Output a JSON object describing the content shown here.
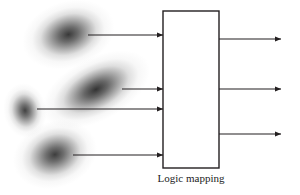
{
  "figure": {
    "background_color": "#ffffff",
    "stroke_color": "#231f20",
    "blob_color": "#4a4a4a",
    "caption": "Logic mapping",
    "caption_font_size": 11
  },
  "process_box": {
    "name": "Logic mapping",
    "x": 163,
    "y": 11,
    "width": 56,
    "height": 157,
    "border_color": "#231f20",
    "border_width": 1.4,
    "fill": "#ffffff"
  },
  "blobs": [
    {
      "id": "blob-1",
      "label": "",
      "cx": 68,
      "cy": 35,
      "rx": 24,
      "ry": 17,
      "rotation": -18,
      "intensity": 0.92
    },
    {
      "id": "blob-2",
      "label": "",
      "cx": 96,
      "cy": 90,
      "rx": 30,
      "ry": 16,
      "rotation": -28,
      "intensity": 0.95
    },
    {
      "id": "blob-3",
      "label": "",
      "cx": 25,
      "cy": 110,
      "rx": 11,
      "ry": 14,
      "rotation": -10,
      "intensity": 0.88
    },
    {
      "id": "blob-4",
      "label": "",
      "cx": 55,
      "cy": 155,
      "rx": 22,
      "ry": 17,
      "rotation": -20,
      "intensity": 0.9
    }
  ],
  "input_arrows": [
    {
      "id": "input-arrow-1",
      "x1": 88,
      "y1": 35,
      "x2": 163,
      "y2": 35
    },
    {
      "id": "input-arrow-2",
      "x1": 122,
      "y1": 89,
      "x2": 163,
      "y2": 89
    },
    {
      "id": "input-arrow-3",
      "x1": 37,
      "y1": 109,
      "x2": 163,
      "y2": 109
    },
    {
      "id": "input-arrow-4",
      "x1": 73,
      "y1": 155,
      "x2": 163,
      "y2": 155
    }
  ],
  "output_arrows": [
    {
      "id": "output-arrow-1",
      "x1": 219,
      "y1": 39,
      "x2": 281,
      "y2": 39
    },
    {
      "id": "output-arrow-2",
      "x1": 219,
      "y1": 89,
      "x2": 281,
      "y2": 89
    },
    {
      "id": "output-arrow-3",
      "x1": 219,
      "y1": 134,
      "x2": 281,
      "y2": 134
    }
  ],
  "caption_position": {
    "x": 163,
    "y": 172,
    "width": 56
  }
}
